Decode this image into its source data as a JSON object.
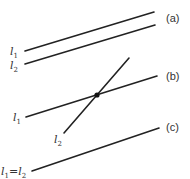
{
  "colors": {
    "line": "#222222",
    "text": "#333333",
    "background": "#ffffff"
  },
  "panels": [
    {
      "id": "a",
      "case_label": "(a)",
      "description": "parallel lines",
      "lines": [
        {
          "name": "l",
          "sub": "1",
          "x1": 25,
          "y1": 51,
          "x2": 154,
          "y2": 12
        },
        {
          "name": "l",
          "sub": "2",
          "x1": 25,
          "y1": 64,
          "x2": 155,
          "y2": 25
        }
      ]
    },
    {
      "id": "b",
      "case_label": "(b)",
      "description": "intersecting lines",
      "lines": [
        {
          "name": "l",
          "sub": "1",
          "x1": 26,
          "y1": 117,
          "x2": 157,
          "y2": 76
        },
        {
          "name": "l",
          "sub": "2",
          "x1": 64,
          "y1": 133,
          "x2": 129,
          "y2": 58
        }
      ],
      "intersection": {
        "x": 97,
        "y": 95
      }
    },
    {
      "id": "c",
      "case_label": "(c)",
      "description": "coincident lines",
      "lines": [
        {
          "name": "l",
          "sub": "1=l2",
          "x1": 32,
          "y1": 171,
          "x2": 159,
          "y2": 128
        }
      ],
      "label_parts": {
        "l1": "l",
        "s1": "1",
        "eq": "=",
        "l2": "l",
        "s2": "2"
      }
    }
  ],
  "labels": {
    "a_l": "l",
    "a_1": "1",
    "a_l2": "l",
    "a_2": "2",
    "b_l": "l",
    "b_1": "1",
    "b_l2": "l",
    "b_2": "2",
    "c_l": "l",
    "c_1": "1",
    "c_eq": "=",
    "c_l2": "l",
    "c_2": "2",
    "case_a": "(a)",
    "case_b": "(b)",
    "case_c": "(c)"
  }
}
